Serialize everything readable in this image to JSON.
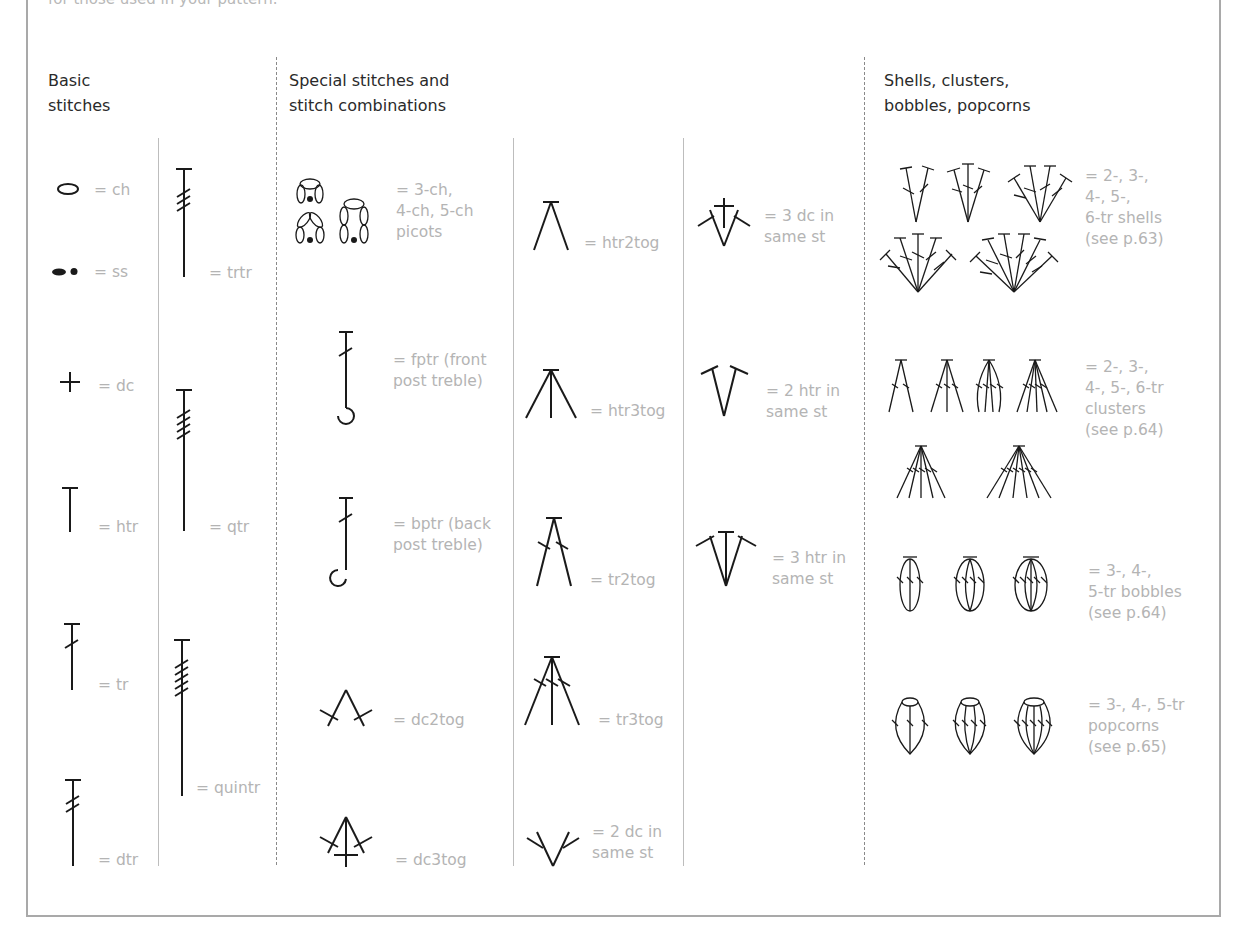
{
  "intro_text": "for those used in your pattern.",
  "sections": {
    "basic": {
      "title_line1": "Basic",
      "title_line2": "stitches"
    },
    "special": {
      "title_line1": "Special stitches and",
      "title_line2": "stitch combinations"
    },
    "shells": {
      "title_line1": "Shells, clusters,",
      "title_line2": "bobbles, popcorns"
    }
  },
  "basic_col1": [
    {
      "symbol": "chain-icon",
      "label": "= ch"
    },
    {
      "symbol": "slip-stitch-icon",
      "label": "= ss"
    },
    {
      "symbol": "double-crochet-icon",
      "label": "= dc"
    },
    {
      "symbol": "half-treble-icon",
      "label": "= htr"
    },
    {
      "symbol": "treble-icon",
      "label": "= tr"
    },
    {
      "symbol": "double-treble-icon",
      "label": "= dtr"
    }
  ],
  "basic_col2": [
    {
      "symbol": "triple-treble-icon",
      "label": "= trtr"
    },
    {
      "symbol": "quadruple-treble-icon",
      "label": "= qtr"
    },
    {
      "symbol": "quintuple-treble-icon",
      "label": "= quintr"
    }
  ],
  "special_col1": [
    {
      "symbol": "picots-icon",
      "label_lines": [
        "= 3-ch,",
        "4-ch, 5-ch",
        "picots"
      ]
    },
    {
      "symbol": "front-post-treble-icon",
      "label_lines": [
        "= fptr (front",
        "post treble)"
      ]
    },
    {
      "symbol": "back-post-treble-icon",
      "label_lines": [
        "= bptr (back",
        "post treble)"
      ]
    },
    {
      "symbol": "dc2tog-icon",
      "label_lines": [
        "= dc2tog"
      ]
    },
    {
      "symbol": "dc3tog-icon",
      "label_lines": [
        "= dc3tog"
      ]
    }
  ],
  "special_col2": [
    {
      "symbol": "htr2tog-icon",
      "label_lines": [
        "= htr2tog"
      ]
    },
    {
      "symbol": "htr3tog-icon",
      "label_lines": [
        "= htr3tog"
      ]
    },
    {
      "symbol": "tr2tog-icon",
      "label_lines": [
        "= tr2tog"
      ]
    },
    {
      "symbol": "tr3tog-icon",
      "label_lines": [
        "= tr3tog"
      ]
    },
    {
      "symbol": "two-dc-same-st-icon",
      "label_lines": [
        "= 2 dc in",
        "same st"
      ]
    }
  ],
  "special_col3": [
    {
      "symbol": "three-dc-same-st-icon",
      "label_lines": [
        "= 3 dc in",
        "same st"
      ]
    },
    {
      "symbol": "two-htr-same-st-icon",
      "label_lines": [
        "= 2 htr in",
        "same st"
      ]
    },
    {
      "symbol": "three-htr-same-st-icon",
      "label_lines": [
        "= 3 htr in",
        "same st"
      ]
    }
  ],
  "shells_col": [
    {
      "symbol": "tr-shells-icon",
      "label_lines": [
        "= 2-, 3-,",
        "4-, 5-,",
        "6-tr shells",
        "(see p.63)"
      ]
    },
    {
      "symbol": "tr-clusters-icon",
      "label_lines": [
        "= 2-, 3-,",
        "4-, 5-, 6-tr",
        "clusters",
        "(see p.64)"
      ]
    },
    {
      "symbol": "tr-bobbles-icon",
      "label_lines": [
        "= 3-, 4-,",
        "5-tr bobbles",
        "(see p.64)"
      ]
    },
    {
      "symbol": "tr-popcorns-icon",
      "label_lines": [
        "= 3-, 4-, 5-tr",
        "popcorns",
        "(see p.65)"
      ]
    }
  ],
  "colors": {
    "symbol": "#1a1a1a",
    "label": "#b4b4b4",
    "heading": "#2a2a2a",
    "frame": "#a9a9a9"
  }
}
